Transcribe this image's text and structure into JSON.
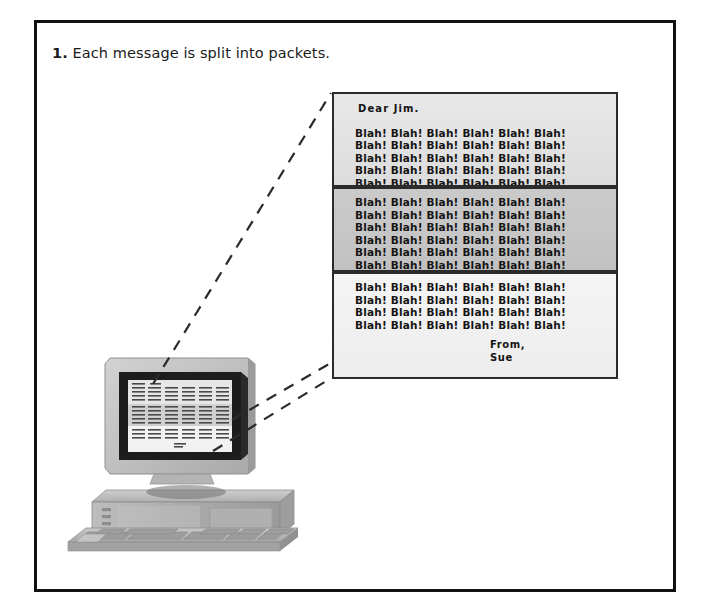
{
  "figure": {
    "caption_number": "1.",
    "caption_text": "Each message is split into packets.",
    "frame_border_color": "#111111",
    "page_background": "#ffffff"
  },
  "message_document": {
    "salutation": "Dear  Jim.",
    "signoff": [
      "From,",
      "Sue"
    ],
    "blah_token": "Blah!",
    "packets": [
      {
        "name": "packet-1",
        "label": "packet-1",
        "fill_color": "#e4e4e4",
        "has_salutation": true,
        "blah_lines": [
          "Blah! Blah! Blah! Blah! Blah! Blah!",
          "Blah! Blah! Blah! Blah! Blah! Blah!",
          "Blah! Blah! Blah! Blah! Blah! Blah!",
          "Blah! Blah! Blah! Blah! Blah! Blah!",
          "Blah! Blah! Blah! Blah! Blah! Blah!"
        ],
        "has_signoff": false
      },
      {
        "name": "packet-2",
        "label": "packet-2",
        "fill_color": "#c6c6c6",
        "has_salutation": false,
        "blah_lines": [
          "Blah! Blah! Blah! Blah! Blah! Blah!",
          "Blah! Blah! Blah! Blah! Blah! Blah!",
          "Blah! Blah! Blah! Blah! Blah! Blah!",
          "Blah! Blah! Blah! Blah! Blah! Blah!",
          "Blah! Blah! Blah! Blah! Blah! Blah!",
          "Blah! Blah! Blah! Blah! Blah! Blah!",
          "Blah! Blah! Blah! Blah! Blah! Blah!"
        ],
        "has_signoff": false
      },
      {
        "name": "packet-3",
        "label": "packet-3",
        "fill_color": "#f1f1f1",
        "has_salutation": false,
        "blah_lines": [
          "Blah! Blah! Blah! Blah! Blah! Blah!",
          "Blah! Blah! Blah! Blah! Blah! Blah!",
          "Blah! Blah! Blah! Blah! Blah! Blah!",
          "Blah! Blah! Blah! Blah! Blah! Blah!"
        ],
        "has_signoff": true
      }
    ]
  },
  "computer": {
    "label": "desktop-computer",
    "parts": [
      "monitor",
      "screen",
      "system-unit",
      "keyboard"
    ],
    "screen_content": "miniature-message-document",
    "case_color": "#b8b8b8",
    "bezel_color": "#1d1d1d",
    "screen_color": "#f0f0f0"
  },
  "lead_lines": {
    "label": "callout-lines",
    "style": "dashed",
    "color": "#2b2b2b",
    "count": 2
  }
}
